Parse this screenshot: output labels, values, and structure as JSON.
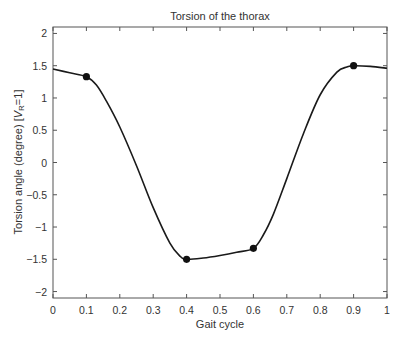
{
  "chart_data": {
    "type": "line",
    "title": "Torsion of the thorax",
    "xlabel": "Gait cycle",
    "ylabel": "Torsion angle (degree) [V_R=1]",
    "ylabel_main": "Torsion angle (degree) [",
    "ylabel_var": "V",
    "ylabel_sub": "R",
    "ylabel_end": "=1]",
    "xlim": [
      0,
      1
    ],
    "ylim": [
      -2.1,
      2.1
    ],
    "xticks": [
      0,
      0.1,
      0.2,
      0.3,
      0.4,
      0.5,
      0.6,
      0.7,
      0.8,
      0.9,
      1
    ],
    "xtick_labels": [
      "0",
      "0.1",
      "0.2",
      "0.3",
      "0.4",
      "0.5",
      "0.6",
      "0.7",
      "0.8",
      "0.9",
      "1"
    ],
    "yticks": [
      -2,
      -1.5,
      -1,
      -0.5,
      0,
      0.5,
      1,
      1.5,
      2
    ],
    "ytick_labels": [
      "−2",
      "−1.5",
      "−1",
      "−0.5",
      "0",
      "0.5",
      "1",
      "1.5",
      "2"
    ],
    "grid": false,
    "legend": null,
    "series": [
      {
        "name": "Torsion of the thorax",
        "color": "#1a1a1a",
        "x": [
          0,
          0.05,
          0.1,
          0.13,
          0.16,
          0.2,
          0.25,
          0.3,
          0.35,
          0.38,
          0.4,
          0.45,
          0.5,
          0.55,
          0.6,
          0.63,
          0.66,
          0.7,
          0.75,
          0.8,
          0.85,
          0.88,
          0.9,
          0.95,
          1
        ],
        "y": [
          1.45,
          1.39,
          1.33,
          1.2,
          0.95,
          0.55,
          -0.05,
          -0.7,
          -1.25,
          -1.45,
          -1.5,
          -1.48,
          -1.44,
          -1.39,
          -1.33,
          -1.12,
          -0.8,
          -0.25,
          0.45,
          1.05,
          1.4,
          1.48,
          1.5,
          1.49,
          1.46
        ]
      }
    ],
    "markers": [
      {
        "x": 0.1,
        "y": 1.33
      },
      {
        "x": 0.4,
        "y": -1.5
      },
      {
        "x": 0.6,
        "y": -1.33
      },
      {
        "x": 0.9,
        "y": 1.5
      }
    ]
  }
}
